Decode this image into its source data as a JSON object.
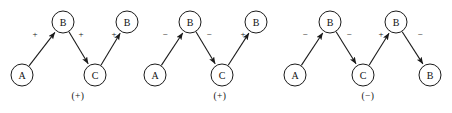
{
  "figure": {
    "background_color": "#ffffff",
    "stroke_color": "#1a1a1a",
    "text_color": "#111111",
    "node_radius": 11,
    "arrowhead": "filled-triangle-arrow-icon"
  },
  "diagrams": [
    {
      "id": "diagram-1",
      "result_label": "(+)",
      "result_x": 78,
      "result_y": 96,
      "nodes": [
        {
          "id": "d1-n1",
          "label": "A",
          "cx": 22,
          "cy": 75
        },
        {
          "id": "d1-n2",
          "label": "B",
          "cx": 63,
          "cy": 22
        },
        {
          "id": "d1-n3",
          "label": "C",
          "cx": 95,
          "cy": 75
        },
        {
          "id": "d1-n4",
          "label": "B",
          "cx": 127,
          "cy": 22
        }
      ],
      "edges": [
        {
          "id": "d1-e1",
          "from": "d1-n1",
          "to": "d1-n2",
          "sign": "+",
          "sign_x": 35,
          "sign_y": 34
        },
        {
          "id": "d1-e2",
          "from": "d1-n2",
          "to": "d1-n3",
          "sign": "+",
          "sign_x": 81,
          "sign_y": 34
        },
        {
          "id": "d1-e3",
          "from": "d1-n3",
          "to": "d1-n4",
          "sign": "+",
          "sign_x": 114,
          "sign_y": 34
        }
      ]
    },
    {
      "id": "diagram-2",
      "result_label": "(+)",
      "result_x": 220,
      "result_y": 96,
      "nodes": [
        {
          "id": "d2-n1",
          "label": "A",
          "cx": 155,
          "cy": 75
        },
        {
          "id": "d2-n2",
          "label": "B",
          "cx": 190,
          "cy": 22
        },
        {
          "id": "d2-n3",
          "label": "C",
          "cx": 222,
          "cy": 75
        },
        {
          "id": "d2-n4",
          "label": "B",
          "cx": 256,
          "cy": 22
        }
      ],
      "edges": [
        {
          "id": "d2-e1",
          "from": "d2-n1",
          "to": "d2-n2",
          "sign": "−",
          "sign_x": 165,
          "sign_y": 34
        },
        {
          "id": "d2-e2",
          "from": "d2-n2",
          "to": "d2-n3",
          "sign": "−",
          "sign_x": 209,
          "sign_y": 34
        },
        {
          "id": "d2-e3",
          "from": "d2-n3",
          "to": "d2-n4",
          "sign": "+",
          "sign_x": 243,
          "sign_y": 34
        }
      ]
    },
    {
      "id": "diagram-3",
      "result_label": "(−)",
      "result_x": 368,
      "result_y": 96,
      "nodes": [
        {
          "id": "d3-n1",
          "label": "A",
          "cx": 295,
          "cy": 75
        },
        {
          "id": "d3-n2",
          "label": "B",
          "cx": 330,
          "cy": 22
        },
        {
          "id": "d3-n3",
          "label": "C",
          "cx": 363,
          "cy": 75
        },
        {
          "id": "d3-n4",
          "label": "B",
          "cx": 396,
          "cy": 22
        },
        {
          "id": "d3-n5",
          "label": "B",
          "cx": 430,
          "cy": 75
        }
      ],
      "edges": [
        {
          "id": "d3-e1",
          "from": "d3-n1",
          "to": "d3-n2",
          "sign": "−",
          "sign_x": 305,
          "sign_y": 34
        },
        {
          "id": "d3-e2",
          "from": "d3-n2",
          "to": "d3-n3",
          "sign": "−",
          "sign_x": 349,
          "sign_y": 34
        },
        {
          "id": "d3-e3",
          "from": "d3-n3",
          "to": "d3-n4",
          "sign": "+",
          "sign_x": 381,
          "sign_y": 34
        },
        {
          "id": "d3-e4",
          "from": "d3-n4",
          "to": "d3-n5",
          "sign": "−",
          "sign_x": 420,
          "sign_y": 34
        }
      ]
    }
  ]
}
